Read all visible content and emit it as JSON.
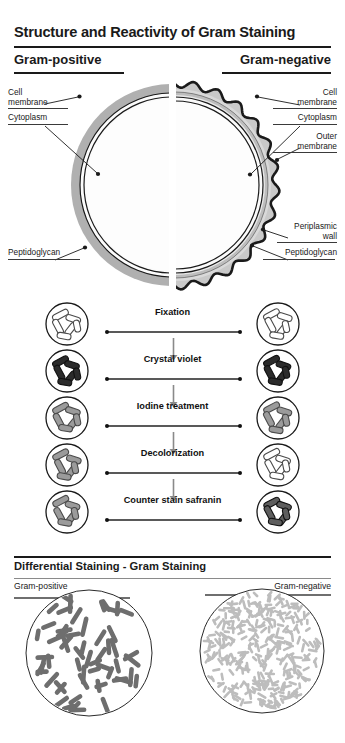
{
  "header": {
    "title": "Structure and Reactivity of Gram Staining",
    "left_heading": "Gram-positive",
    "right_heading": "Gram-negative"
  },
  "cell_diagram": {
    "left_labels": [
      {
        "id": "cell-membrane",
        "line1": "Cell",
        "line2": "membrane"
      },
      {
        "id": "cytoplasm",
        "line1": "Cytoplasm",
        "line2": ""
      },
      {
        "id": "peptidoglycan",
        "line1": "Peptidoglycan",
        "line2": ""
      }
    ],
    "right_labels": [
      {
        "id": "cell-membrane",
        "line1": "Cell",
        "line2": "membrane"
      },
      {
        "id": "cytoplasm",
        "line1": "Cytoplasm",
        "line2": ""
      },
      {
        "id": "outer-membrane",
        "line1": "Outer",
        "line2": "membrane"
      },
      {
        "id": "periplasmic-wall",
        "line1": "Periplasmic",
        "line2": "wall"
      },
      {
        "id": "peptidoglycan",
        "line1": "Peptidoglycan",
        "line2": ""
      }
    ],
    "colors": {
      "peptidoglycan_thick": "#b0b0b0",
      "periplasm": "#d8d8d8",
      "cytoplasm": "#fafafa",
      "membrane_line": "#1a1a1a",
      "outer_membrane": "#1a1a1a"
    }
  },
  "process": {
    "steps": [
      {
        "label": "Fixation",
        "positive_stain": "unstained",
        "negative_stain": "unstained"
      },
      {
        "label": "Crystal violet",
        "positive_stain": "dark",
        "negative_stain": "dark"
      },
      {
        "label": "Iodine treatment",
        "positive_stain": "mid",
        "negative_stain": "mid"
      },
      {
        "label": "Decolorization",
        "positive_stain": "mid",
        "negative_stain": "unstained"
      },
      {
        "label": "Counter stain safranin",
        "positive_stain": "mid",
        "negative_stain": "dark-mid"
      }
    ],
    "colors": {
      "unstained": "#ffffff",
      "mid": "#9b9b9b",
      "dark": "#2b2b2b",
      "dark-mid": "#5e5e5e",
      "outline": "#1a1a1a"
    }
  },
  "bottom": {
    "title": "Differential Staining - Gram Staining",
    "left_label": "Gram-positive",
    "right_label": "Gram-negative",
    "left_cell_color": "#6e6e6e",
    "right_cell_color": "#bdbdbd",
    "left_cell_count": 58,
    "right_cell_count": 310
  }
}
